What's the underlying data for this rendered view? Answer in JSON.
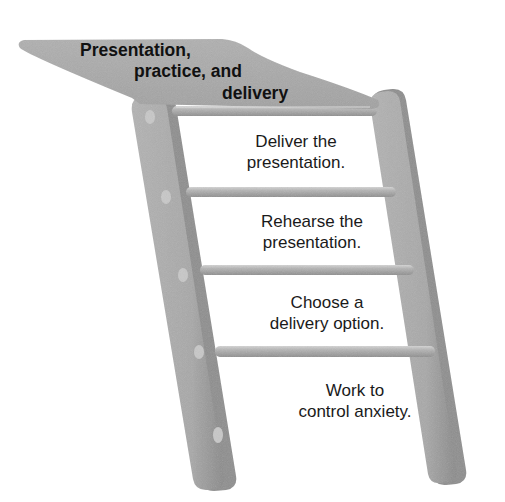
{
  "diagram": {
    "type": "ladder",
    "title_lines": [
      "Presentation,",
      "practice, and",
      "delivery"
    ],
    "steps": [
      {
        "order": 4,
        "lines": [
          "Deliver the",
          "presentation."
        ]
      },
      {
        "order": 3,
        "lines": [
          "Rehearse the",
          "presentation."
        ]
      },
      {
        "order": 2,
        "lines": [
          "Choose a",
          "delivery option."
        ]
      },
      {
        "order": 1,
        "lines": [
          "Work to",
          "control anxiety."
        ]
      }
    ],
    "colors": {
      "rail": "#aaaaaa",
      "rail_shadow": "#8c8c8c",
      "rail_highlight": "#c9c9c9",
      "platform": "#a9a9a9",
      "text": "#1a1a1a",
      "background": "#ffffff"
    }
  }
}
